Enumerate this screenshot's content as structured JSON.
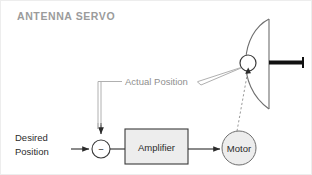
{
  "title": "ANTENNA SERVO",
  "diagram": {
    "type": "control-system-block-diagram",
    "input_label_line1": "Desired",
    "input_label_line2": "Position",
    "feedback_label": "Actual Position",
    "amplifier_label": "Amplifier",
    "motor_label": "Motor",
    "summing_sign": "−"
  },
  "colors": {
    "title": "#9b9b9b",
    "wire": "#2b2b2b",
    "feedback_wire": "#b0b0b0",
    "block_fill": "#ededed",
    "block_stroke": "#3a3a3a",
    "dash": "#9a9a9a",
    "feed_arm": "#111111",
    "label_dark": "#2b2b2b",
    "label_grey": "#8f8f8f",
    "background": "#ffffff"
  },
  "elements": {
    "summing_junction": {
      "cx": 100,
      "cy": 148,
      "r": 9
    },
    "amplifier_block": {
      "x": 124,
      "y": 128,
      "w": 63,
      "h": 35
    },
    "motor_block": {
      "cx": 238,
      "cy": 147,
      "r": 17
    },
    "antenna_pivot": {
      "cx": 247,
      "cy": 62,
      "r": 8
    }
  }
}
